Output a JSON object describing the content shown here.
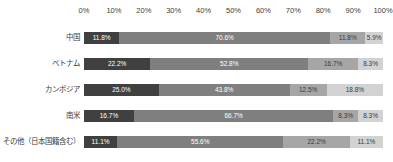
{
  "chart_data": {
    "type": "bar",
    "variant": "stacked-horizontal",
    "title": "",
    "xlabel": "",
    "ylabel": "",
    "xlim": [
      0,
      100
    ],
    "grid": false,
    "legend": false,
    "axis_ticks": [
      "0%",
      "10%",
      "20%",
      "30%",
      "40%",
      "50%",
      "60%",
      "70%",
      "80%",
      "90%",
      "100%"
    ],
    "palette": [
      "#404040",
      "#7f7f7f",
      "#a6a6a6",
      "#d2d2d2"
    ],
    "label_text_colors": [
      "#ffffff",
      "#ffffff",
      "#3a3a3a",
      "#3a3a3a"
    ],
    "rows": [
      {
        "category": "中国",
        "values": [
          11.8,
          70.6,
          11.8,
          5.9
        ],
        "labels": [
          "11.8%",
          "70.6%",
          "11.8%",
          "5.9%"
        ]
      },
      {
        "category": "ベトナム",
        "values": [
          22.2,
          52.8,
          16.7,
          8.3
        ],
        "labels": [
          "22.2%",
          "52.8%",
          "16.7%",
          "8.3%"
        ]
      },
      {
        "category": "カンボジア",
        "values": [
          25.0,
          43.8,
          12.5,
          18.8
        ],
        "labels": [
          "25.0%",
          "43.8%",
          "12.5%",
          "18.8%"
        ]
      },
      {
        "category": "南米",
        "values": [
          16.7,
          66.7,
          8.3,
          8.3
        ],
        "labels": [
          "16.7%",
          "66.7%",
          "8.3%",
          "8.3%"
        ]
      },
      {
        "category": "その他（日本国籍含む）",
        "values": [
          11.1,
          55.6,
          22.2,
          11.1
        ],
        "labels": [
          "11.1%",
          "55.6%",
          "22.2%",
          "11.1%"
        ]
      }
    ]
  }
}
